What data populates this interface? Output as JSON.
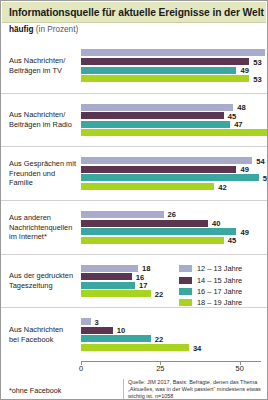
{
  "header": {
    "title": "Informationsquelle für aktuelle Ereignisse in der Welt",
    "subtitle_bold": "häufig",
    "subtitle_rest": "(in Prozent)"
  },
  "footnote": "*ohne Facebook",
  "source": "Quelle: JIM 2017, Basis: Befragte, denen das Thema „Aktuelles, was in der Welt passiert“ mindestens etwas wichtig ist. n=1058",
  "legend": {
    "items": [
      {
        "label": "12 – 13 Jahre",
        "color": "#a9abcd"
      },
      {
        "label": "14 – 15 Jahre",
        "color": "#5c3650"
      },
      {
        "label": "16 – 17 Jahre",
        "color": "#3aa8a0"
      },
      {
        "label": "18 – 19 Jahre",
        "color": "#a8d420"
      }
    ]
  },
  "chart_data": {
    "type": "bar",
    "orientation": "horizontal",
    "title": "Informationsquelle für aktuelle Ereignisse in der Welt",
    "subtitle": "häufig (in Prozent)",
    "xlabel": "",
    "ylabel": "",
    "xlim": [
      0,
      75
    ],
    "xticks": [
      0,
      25,
      50,
      75
    ],
    "grid": false,
    "legend_position": "middle-right",
    "categories": [
      "Aus Nachrichten/ Beiträgen im TV",
      "Aus Nachrichten/ Beiträgen im Radio",
      "Aus Gesprächen mit Freunden und Familie",
      "Aus anderen Nachrichtenquellen im Internet*",
      "Aus der gedruckten Tageszeitung",
      "Aus Nachrichten bei Facebook"
    ],
    "category_lines": [
      [
        "Aus Nachrichten/",
        "Beiträgen im TV"
      ],
      [
        "Aus Nachrichten/",
        "Beiträgen im Radio"
      ],
      [
        "Aus Gesprächen mit",
        "Freunden und Familie"
      ],
      [
        "Aus anderen",
        "Nachrichtenquellen",
        "im Internet*"
      ],
      [
        "Aus der gedruckten",
        "Tageszeitung"
      ],
      [
        "Aus Nachrichten",
        "bei Facebook"
      ]
    ],
    "series": [
      {
        "name": "12 – 13 Jahre",
        "color": "#a9abcd",
        "values": [
          58,
          48,
          54,
          26,
          18,
          3
        ]
      },
      {
        "name": "14 – 15 Jahre",
        "color": "#5c3650",
        "values": [
          53,
          45,
          49,
          40,
          16,
          10
        ]
      },
      {
        "name": "16 – 17 Jahre",
        "color": "#3aa8a0",
        "values": [
          49,
          47,
          56,
          49,
          17,
          22
        ]
      },
      {
        "name": "18 – 19 Jahre",
        "color": "#a8d420",
        "values": [
          53,
          60,
          42,
          45,
          22,
          34
        ]
      }
    ]
  }
}
